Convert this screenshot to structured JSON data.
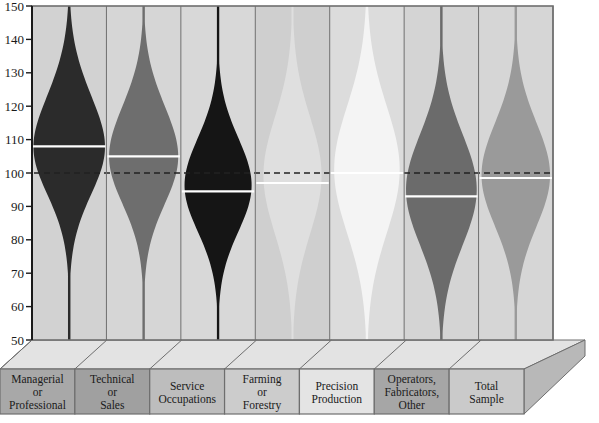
{
  "chart_data": {
    "type": "violin",
    "title": "",
    "xlabel": "",
    "ylabel": "",
    "ylim": [
      50,
      150
    ],
    "ytick_values": [
      50,
      60,
      70,
      80,
      90,
      100,
      110,
      120,
      130,
      140,
      150
    ],
    "ytick_labels": [
      "50",
      "60",
      "70",
      "80",
      "90",
      "100",
      "110",
      "120",
      "130",
      "140",
      "150"
    ],
    "grid": false,
    "legend": "none",
    "reference_line": {
      "value": 100,
      "style": "dashed",
      "color": "#222222",
      "label": ""
    },
    "categories": [
      "Managerial or Professional",
      "Technical or Sales",
      "Service Occupations",
      "Farming or Forestry",
      "Precision Production",
      "Operators, Fabricators, Other",
      "Total Sample"
    ],
    "category_label_lines": [
      [
        "Managerial",
        "or",
        "Professional"
      ],
      [
        "Technical",
        "or",
        "Sales"
      ],
      [
        "Service",
        "Occupations"
      ],
      [
        "Farming",
        "or",
        "Forestry"
      ],
      [
        "Precision",
        "Production"
      ],
      [
        "Operators,",
        "Fabricators,",
        "Other"
      ],
      [
        "Total",
        "Sample"
      ]
    ],
    "series": [
      {
        "name": "Managerial or Professional",
        "median": 108.0,
        "fill": "#2b2b2b",
        "panel_fill": "#d2d2d2",
        "tile_fill": "#a8a8a8",
        "peak": 111,
        "spread": 15.5,
        "max_halfwidth": 0.94,
        "skew": -0.22
      },
      {
        "name": "Technical or Sales",
        "median": 105.0,
        "fill": "#6e6e6e",
        "panel_fill": "#d6d6d6",
        "tile_fill": "#a0a0a0",
        "peak": 107,
        "spread": 15.0,
        "max_halfwidth": 0.92,
        "skew": -0.14
      },
      {
        "name": "Service Occupations",
        "median": 94.5,
        "fill": "#151515",
        "panel_fill": "#d8d8d8",
        "tile_fill": "#bdbdbd",
        "peak": 97,
        "spread": 14.0,
        "max_halfwidth": 0.9,
        "skew": -0.05
      },
      {
        "name": "Farming or Forestry",
        "median": 97.0,
        "fill": "#dfdfdf",
        "panel_fill": "#cfcfcf",
        "tile_fill": "#cccccc",
        "peak": 99,
        "spread": 17.5,
        "max_halfwidth": 0.78,
        "skew": 0.02
      },
      {
        "name": "Precision Production",
        "median": 100.0,
        "fill": "#f4f4f4",
        "panel_fill": "#dcdcdc",
        "tile_fill": "#e4e4e4",
        "peak": 101,
        "spread": 19.0,
        "max_halfwidth": 0.88,
        "skew": 0.0
      },
      {
        "name": "Operators, Fabricators, Other",
        "median": 93.0,
        "fill": "#6b6b6b",
        "panel_fill": "#d4d4d4",
        "tile_fill": "#a6a6a6",
        "peak": 95,
        "spread": 16.5,
        "max_halfwidth": 0.95,
        "skew": 0.0
      },
      {
        "name": "Total Sample",
        "median": 98.5,
        "fill": "#9a9a9a",
        "panel_fill": "#d6d6d6",
        "tile_fill": "#cacaca",
        "peak": 100,
        "spread": 15.5,
        "max_halfwidth": 0.92,
        "skew": -0.04
      }
    ],
    "colors": {
      "axis": "#1a1a1a",
      "panel_border": "#6e6e6e",
      "median_line": "#ffffff",
      "base_top": "#e3e3e3",
      "base_side": "#b8b8b8"
    }
  }
}
